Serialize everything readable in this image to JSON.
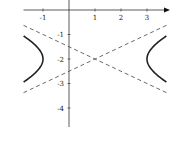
{
  "chart_data": {
    "type": "line",
    "title": "",
    "xlabel": "",
    "ylabel": "",
    "xlim": [
      -1.75,
      3.75
    ],
    "ylim": [
      -4.7,
      0.4
    ],
    "grid": false,
    "legend": null,
    "x_ticks": [
      -1,
      1,
      2,
      3
    ],
    "x_tick_labels": [
      "-1",
      "1",
      "2",
      "3"
    ],
    "y_ticks": [
      -1,
      -2,
      -3,
      -4
    ],
    "y_tick_labels": [
      "-1",
      "-2",
      "-3",
      "-4"
    ],
    "equation": "(x-1)^2/4 - (y+2)^2 = 1",
    "center": [
      1,
      -2
    ],
    "vertices": [
      [
        -1,
        -2
      ],
      [
        3,
        -2
      ]
    ],
    "series": [
      {
        "name": "hyperbola-left-branch",
        "style": "solid",
        "color": "#222222",
        "points": [
          [
            -1.75,
            -1.06
          ],
          [
            -1.5,
            -1.25
          ],
          [
            -1.25,
            -1.48
          ],
          [
            -1.0,
            -2.0
          ],
          [
            -1.25,
            -2.52
          ],
          [
            -1.5,
            -2.75
          ],
          [
            -1.75,
            -2.94
          ]
        ]
      },
      {
        "name": "hyperbola-right-branch",
        "style": "solid",
        "color": "#222222",
        "points": [
          [
            3.75,
            -1.06
          ],
          [
            3.5,
            -1.25
          ],
          [
            3.25,
            -1.48
          ],
          [
            3.0,
            -2.0
          ],
          [
            3.25,
            -2.52
          ],
          [
            3.5,
            -2.75
          ],
          [
            3.75,
            -2.94
          ]
        ]
      },
      {
        "name": "asymptote-1",
        "style": "dashed",
        "color": "#444444",
        "equation": "y = -2 + 0.5(x-1)",
        "points": [
          [
            -1.75,
            -3.375
          ],
          [
            3.75,
            -0.625
          ]
        ]
      },
      {
        "name": "asymptote-2",
        "style": "dashed",
        "color": "#444444",
        "equation": "y = -2 - 0.5(x-1)",
        "points": [
          [
            -1.75,
            -0.625
          ],
          [
            3.75,
            -3.375
          ]
        ]
      }
    ]
  },
  "layout": {
    "origin_px": [
      69,
      10
    ],
    "x_unit_px": 26,
    "y_unit_px": 24.5
  }
}
